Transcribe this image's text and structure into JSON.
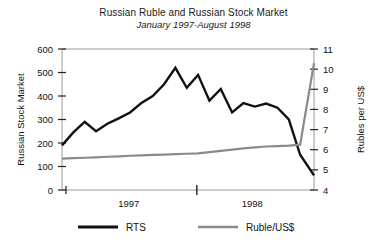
{
  "chart_data": {
    "type": "line",
    "title": "Russian Ruble and Russian Stock Market",
    "subtitle": "January 1997-August 1998",
    "xlabel": "",
    "ylabel": "Russian Stock Market",
    "y2label": "Rubles per US$",
    "ylim": [
      0,
      600
    ],
    "y2lim": [
      4,
      11
    ],
    "yticks": [
      "0",
      "100",
      "200",
      "300",
      "400",
      "500",
      "600"
    ],
    "ytick_values": [
      0,
      100,
      200,
      300,
      400,
      500,
      600
    ],
    "y2ticks": [
      "4",
      "5",
      "6",
      "7",
      "8",
      "9",
      "10",
      "11"
    ],
    "y2tick_values": [
      4,
      5,
      6,
      7,
      8,
      9,
      10,
      11
    ],
    "xticks": [
      "1997",
      "1998"
    ],
    "xtick_positions": [
      0.265,
      0.755
    ],
    "x_divider_position": 0.535,
    "grid": false,
    "legend_position": "bottom",
    "series": [
      {
        "name": "RTS",
        "axis": "left",
        "color": "#111111",
        "width": 2.4,
        "x": [
          0.0,
          0.045,
          0.09,
          0.135,
          0.18,
          0.225,
          0.27,
          0.315,
          0.36,
          0.405,
          0.45,
          0.495,
          0.54,
          0.585,
          0.63,
          0.675,
          0.72,
          0.765,
          0.81,
          0.855,
          0.9,
          0.945,
          1.0
        ],
        "values": [
          190,
          245,
          290,
          250,
          282,
          305,
          330,
          370,
          400,
          450,
          520,
          435,
          490,
          380,
          430,
          330,
          370,
          355,
          368,
          350,
          300,
          150,
          62
        ]
      },
      {
        "name": "Ruble/US$",
        "axis": "right",
        "color": "#8a8a8a",
        "width": 2.2,
        "x": [
          0.0,
          0.045,
          0.09,
          0.135,
          0.18,
          0.225,
          0.27,
          0.315,
          0.36,
          0.405,
          0.45,
          0.495,
          0.54,
          0.585,
          0.63,
          0.675,
          0.72,
          0.765,
          0.81,
          0.855,
          0.9,
          0.945,
          1.0
        ],
        "values": [
          5.56,
          5.58,
          5.6,
          5.62,
          5.65,
          5.67,
          5.7,
          5.72,
          5.74,
          5.76,
          5.78,
          5.8,
          5.82,
          5.88,
          5.94,
          6.0,
          6.07,
          6.12,
          6.16,
          6.18,
          6.2,
          6.25,
          10.3
        ]
      }
    ],
    "rts_annotations": {
      "start_value": 190,
      "peak_value": 520,
      "end_value": 62
    },
    "ruble_annotations": {
      "start_value": 5.56,
      "end_value": 10.3
    }
  },
  "legend": {
    "items": [
      {
        "label": "RTS",
        "color": "#111111",
        "width": 3.2
      },
      {
        "label": "Ruble/US$",
        "color": "#8a8a8a",
        "width": 2.4
      }
    ]
  }
}
